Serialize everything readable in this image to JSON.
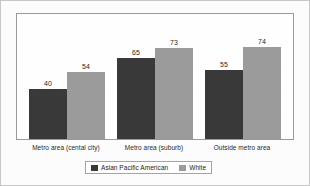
{
  "chart_data": {
    "type": "bar",
    "title": "",
    "subtitle": "",
    "xlabel": "",
    "ylabel": "",
    "ylim": [
      0,
      100
    ],
    "grid": false,
    "legend_position": "bottom",
    "categories": [
      "Metro area (cental city)",
      "Metro area (suburb)",
      "Outside metro area"
    ],
    "series": [
      {
        "name": "Asian Pacific American",
        "color": "#3a3a3a",
        "values": [
          40,
          65,
          55
        ]
      },
      {
        "name": "White",
        "color": "#9c9c9c",
        "values": [
          54,
          73,
          74
        ]
      }
    ],
    "data_labels": [
      [
        "40",
        "54"
      ],
      [
        "65",
        "73"
      ],
      [
        "55",
        "74"
      ]
    ]
  },
  "legend": {
    "items": [
      {
        "label": "Asian Pacific American",
        "swatch": "legend-swatch-dark"
      },
      {
        "label": "White",
        "swatch": "legend-swatch-light"
      }
    ]
  }
}
